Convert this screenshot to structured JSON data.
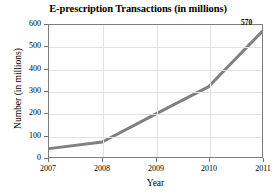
{
  "chart_data": {
    "type": "line",
    "title": "E-prescription Transactions (in millions)",
    "xlabel": "Year",
    "ylabel": "Number (in millions)",
    "categories": [
      "2007",
      "2008",
      "2009",
      "2010",
      "2011"
    ],
    "x": [
      2007,
      2008,
      2009,
      2010,
      2011
    ],
    "values": [
      38,
      68,
      195,
      320,
      570
    ],
    "series": [
      {
        "name": "E-prescription transactions",
        "values": [
          38,
          68,
          195,
          320,
          570
        ],
        "color": "#808080",
        "line_width": 3
      }
    ],
    "xlim": [
      2007,
      2011
    ],
    "ylim": [
      0,
      600
    ],
    "ytick_labels": [
      "0",
      "100",
      "200",
      "300",
      "400",
      "500",
      "600"
    ],
    "ytick_values": [
      0,
      100,
      200,
      300,
      400,
      500,
      600
    ],
    "xtick_labels": [
      "2007",
      "2008",
      "2009",
      "2010",
      "2011"
    ],
    "xtick_values": [
      2007,
      2008,
      2009,
      2010,
      2011
    ],
    "grid": "horizontal-and-vertical",
    "grid_color": "#e2e2e2",
    "legend": "none",
    "annotations": [
      {
        "text": "570",
        "x": 2011,
        "y": 570,
        "position": "above-left-of-endpoint"
      }
    ],
    "frame_color": "#7d7d7d",
    "background": "#ffffff"
  }
}
